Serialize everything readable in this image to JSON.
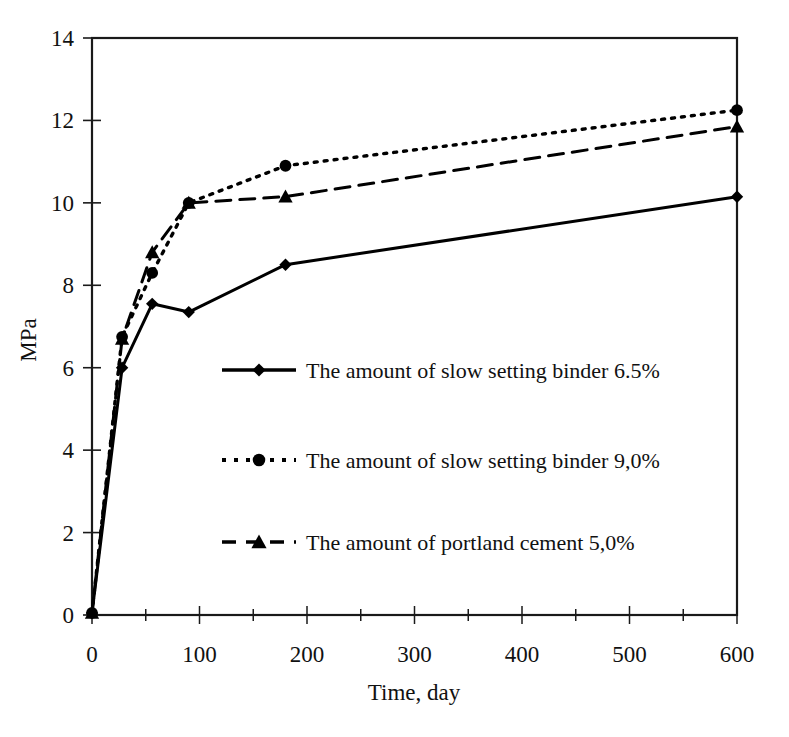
{
  "chart_data": {
    "type": "line",
    "title": "",
    "xlabel": "Time, day",
    "ylabel": "MPa",
    "xlim": [
      0,
      600
    ],
    "ylim": [
      0,
      14
    ],
    "xticks": [
      0,
      100,
      200,
      300,
      400,
      500,
      600
    ],
    "xminor_step": 50,
    "yticks": [
      0,
      2,
      4,
      6,
      8,
      10,
      12,
      14
    ],
    "grid": false,
    "legend_position": "center",
    "frame": "box",
    "series": [
      {
        "name": "The amount of slow setting binder 6.5%",
        "marker": "diamond",
        "linestyle": "solid",
        "color": "#000000",
        "x": [
          0,
          28,
          56,
          90,
          180,
          600
        ],
        "values": [
          0.05,
          6.0,
          7.55,
          7.35,
          8.5,
          10.15
        ]
      },
      {
        "name": "The amount of slow setting binder 9,0%",
        "marker": "circle",
        "linestyle": "dotted",
        "color": "#000000",
        "x": [
          0,
          28,
          56,
          90,
          180,
          600
        ],
        "values": [
          0.05,
          6.75,
          8.3,
          10.0,
          10.9,
          12.25
        ]
      },
      {
        "name": "The amount of portland cement 5,0%",
        "marker": "triangle",
        "linestyle": "dashed",
        "color": "#000000",
        "x": [
          0,
          28,
          56,
          90,
          180,
          600
        ],
        "values": [
          0.05,
          6.7,
          8.8,
          10.0,
          10.15,
          11.85
        ]
      }
    ]
  },
  "axes": {
    "y_title": "MPa",
    "x_title": "Time, day",
    "y_tick_labels": [
      "0",
      "2",
      "4",
      "6",
      "8",
      "10",
      "12",
      "14"
    ],
    "x_tick_labels": [
      "0",
      "100",
      "200",
      "300",
      "400",
      "500",
      "600"
    ]
  },
  "legend": {
    "entries": [
      {
        "label": "The amount of slow setting binder 6.5%",
        "marker": "diamond",
        "style": "solid"
      },
      {
        "label": "The amount of slow setting binder 9,0%",
        "marker": "circle",
        "style": "dotted"
      },
      {
        "label": "The amount of portland cement 5,0%",
        "marker": "triangle",
        "style": "dashed"
      }
    ]
  }
}
